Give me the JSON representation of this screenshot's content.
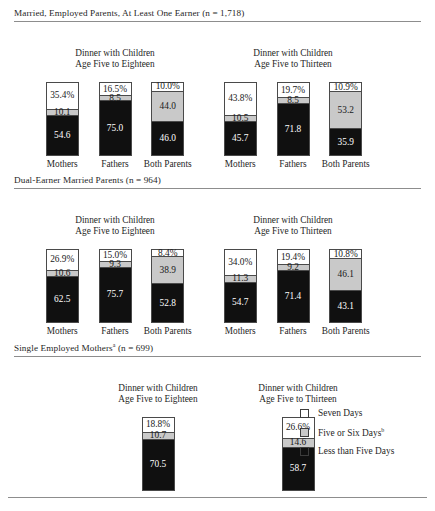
{
  "chart_data": {
    "type": "bar",
    "subtype": "stacked-bar-100",
    "title": "",
    "xlabel": "",
    "ylabel": "",
    "ylim": [
      0,
      100
    ],
    "grid": false,
    "legend_position": "bottom-right",
    "legend": [
      "Seven Days",
      "Five or Six Days",
      "Less than Five Days"
    ],
    "series_colors": [
      "#ffffff",
      "#c9c9c9",
      "#101010"
    ],
    "sections": [
      {
        "header": "Married, Employed Parents, At Least One Earner (n = 1,718)",
        "header_sup": "",
        "panels": [
          {
            "title_line1": "Dinner with Children",
            "title_line2": "Age Five to Eighteen",
            "categories": [
              "Mothers",
              "Fathers",
              "Both Parents"
            ],
            "bars": [
              {
                "category": "Mothers",
                "seven": 35.4,
                "five_six": 10.1,
                "less_five": 54.6,
                "labels": {
                  "seven": "35.4%",
                  "five_six": "10.1",
                  "less_five": "54.6"
                }
              },
              {
                "category": "Fathers",
                "seven": 16.5,
                "five_six": 8.5,
                "less_five": 75.0,
                "labels": {
                  "seven": "16.5%",
                  "five_six": "8.5",
                  "less_five": "75.0"
                }
              },
              {
                "category": "Both Parents",
                "seven": 10.0,
                "five_six": 44.0,
                "less_five": 46.0,
                "labels": {
                  "seven": "10.0%",
                  "five_six": "44.0",
                  "less_five": "46.0"
                }
              }
            ]
          },
          {
            "title_line1": "Dinner with Children",
            "title_line2": "Age Five to Thirteen",
            "categories": [
              "Mothers",
              "Fathers",
              "Both Parents"
            ],
            "bars": [
              {
                "category": "Mothers",
                "seven": 43.8,
                "five_six": 10.5,
                "less_five": 45.7,
                "labels": {
                  "seven": "43.8%",
                  "five_six": "10.5",
                  "less_five": "45.7"
                }
              },
              {
                "category": "Fathers",
                "seven": 19.7,
                "five_six": 8.5,
                "less_five": 71.8,
                "labels": {
                  "seven": "19.7%",
                  "five_six": "8.5",
                  "less_five": "71.8"
                }
              },
              {
                "category": "Both Parents",
                "seven": 10.9,
                "five_six": 53.2,
                "less_five": 35.9,
                "labels": {
                  "seven": "10.9%",
                  "five_six": "53.2",
                  "less_five": "35.9"
                }
              }
            ]
          }
        ]
      },
      {
        "header": "Dual-Earner Married Parents (n = 964)",
        "header_sup": "",
        "panels": [
          {
            "title_line1": "Dinner with Children",
            "title_line2": "Age Five to Eighteen",
            "categories": [
              "Mothers",
              "Fathers",
              "Both Parents"
            ],
            "bars": [
              {
                "category": "Mothers",
                "seven": 26.9,
                "five_six": 10.6,
                "less_five": 62.5,
                "labels": {
                  "seven": "26.9%",
                  "five_six": "10.6",
                  "less_five": "62.5"
                }
              },
              {
                "category": "Fathers",
                "seven": 15.0,
                "five_six": 9.3,
                "less_five": 75.7,
                "labels": {
                  "seven": "15.0%",
                  "five_six": "9.3",
                  "less_five": "75.7"
                }
              },
              {
                "category": "Both Parents",
                "seven": 8.4,
                "five_six": 38.9,
                "less_five": 52.8,
                "labels": {
                  "seven": "8.4%",
                  "five_six": "38.9",
                  "less_five": "52.8"
                }
              }
            ]
          },
          {
            "title_line1": "Dinner with Children",
            "title_line2": "Age Five to Thirteen",
            "categories": [
              "Mothers",
              "Fathers",
              "Both Parents"
            ],
            "bars": [
              {
                "category": "Mothers",
                "seven": 34.0,
                "five_six": 11.3,
                "less_five": 54.7,
                "labels": {
                  "seven": "34.0%",
                  "five_six": "11.3",
                  "less_five": "54.7"
                }
              },
              {
                "category": "Fathers",
                "seven": 19.4,
                "five_six": 9.2,
                "less_five": 71.4,
                "labels": {
                  "seven": "19.4%",
                  "five_six": "9.2",
                  "less_five": "71.4"
                }
              },
              {
                "category": "Both Parents",
                "seven": 10.8,
                "five_six": 46.1,
                "less_five": 43.1,
                "labels": {
                  "seven": "10.8%",
                  "five_six": "46.1",
                  "less_five": "43.1"
                }
              }
            ]
          }
        ]
      },
      {
        "header": "Single Employed Mothers",
        "header_sup": "a",
        "header_tail": " (n = 699)",
        "panels": [
          {
            "title_line1": "Dinner with Children",
            "title_line2": "Age Five to Eighteen",
            "categories": [
              ""
            ],
            "bars": [
              {
                "category": "",
                "seven": 18.8,
                "five_six": 10.7,
                "less_five": 70.5,
                "labels": {
                  "seven": "18.8%",
                  "five_six": "10.7",
                  "less_five": "70.5"
                }
              }
            ]
          },
          {
            "title_line1": "Dinner with Children",
            "title_line2": "Age Five to Thirteen",
            "categories": [
              ""
            ],
            "bars": [
              {
                "category": "",
                "seven": 26.6,
                "five_six": 14.6,
                "less_five": 58.7,
                "labels": {
                  "seven": "26.6%",
                  "five_six": "14.6",
                  "less_five": "58.7"
                }
              }
            ]
          }
        ]
      }
    ]
  },
  "legend": {
    "items": [
      {
        "label": "Seven Days",
        "sup": "",
        "color": "#ffffff"
      },
      {
        "label": "Five or Six Days",
        "sup": "b",
        "color": "#c9c9c9"
      },
      {
        "label": "Less than Five Days",
        "sup": "",
        "color": "#101010"
      }
    ]
  },
  "footer": {
    "source": ""
  }
}
